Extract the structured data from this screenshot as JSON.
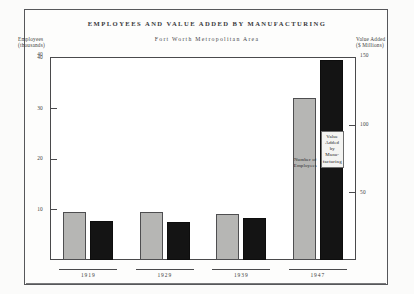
{
  "title": "EMPLOYEES AND VALUE ADDED BY MANUFACTURING",
  "subtitle": "Fort Worth Metropolitan Area",
  "axes": {
    "left_caption_line1": "Employees",
    "left_caption_line2": "(thousands)",
    "right_caption_line1": "Value Added",
    "right_caption_line2": "($ Millions)"
  },
  "annotations": {
    "employees_bar_label": "Number of Employees",
    "value_bar_label": "Value Added by Manu-facturing"
  },
  "chart_data": {
    "type": "bar",
    "title": "EMPLOYEES AND VALUE ADDED BY MANUFACTURING",
    "subtitle": "Fort Worth Metropolitan Area",
    "xlabel": "",
    "categories": [
      "1919",
      "1929",
      "1939",
      "1947"
    ],
    "grid": false,
    "legend_position": "in-plot-annotations",
    "series": [
      {
        "name": "Number of Employees",
        "unit": "thousands",
        "axis": "left",
        "color": "#b6b6b4",
        "values": [
          9.5,
          9.5,
          9.0,
          32.0
        ]
      },
      {
        "name": "Value Added by Manufacturing",
        "unit": "$ Millions",
        "axis": "right",
        "color": "#141414",
        "values": [
          29,
          28,
          31,
          148
        ]
      }
    ],
    "left_axis": {
      "label": "Employees (thousands)",
      "ticks": [
        10,
        20,
        30,
        40
      ],
      "ylim": [
        0,
        40
      ]
    },
    "right_axis": {
      "label": "Value Added ($ Millions)",
      "ticks": [
        50,
        100,
        150
      ],
      "ylim": [
        0,
        150
      ]
    }
  }
}
